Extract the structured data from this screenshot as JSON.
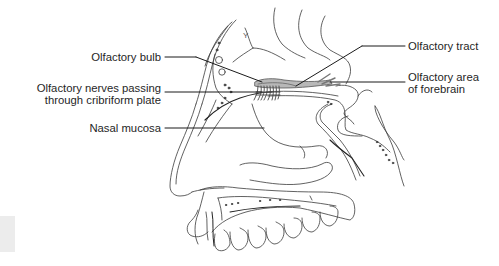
{
  "diagram": {
    "type": "anatomical-sagittal-section",
    "line_color": "#3a3a3a",
    "leader_color": "#1a1a1a",
    "bulb_fill": "#b8b8b8",
    "labels": {
      "olfactory_bulb": "Olfactory bulb",
      "olfactory_nerves_line1": "Olfactory nerves passing",
      "olfactory_nerves_line2": "through cribriform plate",
      "nasal_mucosa": "Nasal mucosa",
      "olfactory_tract": "Olfactory tract",
      "olfactory_area_line1": "Olfactory area",
      "olfactory_area_line2": "of forebrain"
    }
  }
}
